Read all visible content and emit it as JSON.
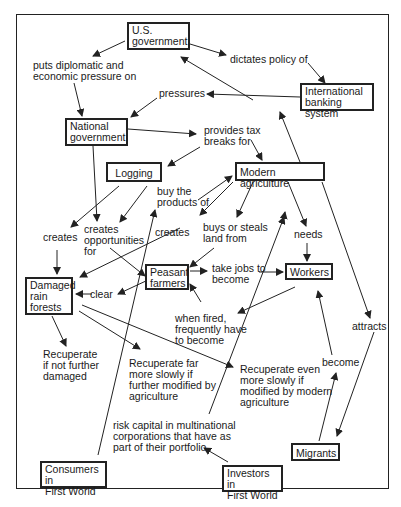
{
  "diagram": {
    "type": "concept-map",
    "nodes": {
      "us_government": "U.S.\ngovernment",
      "international_banking": "International\nbanking system",
      "national_government": "National\ngovernment",
      "logging": "Logging",
      "modern_agriculture": "Modern agriculture",
      "peasant_farmers": "Peasant\nfarmers",
      "workers": "Workers",
      "damaged_rain_forests": "Damaged\nrain\nforests",
      "migrants": "Migrants",
      "consumers": "Consumers in\nFirst World",
      "investors": "Investors in\nFirst World"
    },
    "labels": {
      "puts_pressure": "puts diplomatic and\neconomic pressure on",
      "dictates_policy": "dictates policy of",
      "pressures": "pressures",
      "provides_tax": "provides tax\nbreaks for",
      "buy_products": "buy the\nproducts of",
      "creates_logging": "creates",
      "creates_opportunities": "creates\nopportunities\nfor",
      "creates_agri": "creates",
      "buys_steals": "buys or steals\nland from",
      "needs": "needs",
      "take_jobs": "take jobs to\nbecome",
      "clear": "clear",
      "when_fired": "when fired,\nfrequently have\nto become",
      "attracts": "attracts",
      "become": "become",
      "recuperate1": "Recuperate\nif not further\ndamaged",
      "recuperate2": "Recuperate far\nmore slowly if\nfurther modified by\nagriculture",
      "recuperate3": "Recuperate even\nmore slowly if\nmodified by modern\nagriculture",
      "risk_capital": "risk capital in multinational\ncorporations that have as\npart of their portfolio"
    }
  }
}
